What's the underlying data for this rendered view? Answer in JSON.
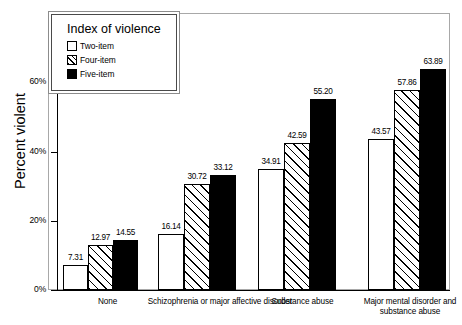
{
  "chart_data": {
    "type": "bar",
    "title": "",
    "xlabel": "",
    "ylabel": "Percent violent",
    "ylim": [
      0,
      80
    ],
    "yticks": [
      "0%",
      "20%",
      "40%",
      "60%"
    ],
    "ytick_values": [
      0,
      20,
      40,
      60
    ],
    "grid": false,
    "legend_title": "Index of violence",
    "legend_position": "top-left inside plot",
    "categories": [
      "None",
      "Schizophrenia or major affective disorder",
      "Substance abuse",
      "Major mental disorder and substance abuse"
    ],
    "series": [
      {
        "name": "Two-item",
        "fill": "white",
        "values": [
          7.31,
          16.14,
          34.91,
          43.57
        ]
      },
      {
        "name": "Four-item",
        "fill": "hatched",
        "values": [
          12.97,
          30.72,
          42.59,
          57.86
        ]
      },
      {
        "name": "Five-item",
        "fill": "black",
        "values": [
          14.55,
          33.12,
          55.2,
          63.89
        ]
      }
    ],
    "value_labels": [
      [
        "7.31",
        "12.97",
        "14.55"
      ],
      [
        "16.14",
        "30.72",
        "33.12"
      ],
      [
        "34.91",
        "42.59",
        "55.20"
      ],
      [
        "43.57",
        "57.86",
        "63.89"
      ]
    ]
  },
  "colors": {
    "axis": "#000000",
    "frame": "#a8a8a8",
    "bar_white": "#ffffff",
    "bar_black": "#000000",
    "text": "#000000"
  }
}
